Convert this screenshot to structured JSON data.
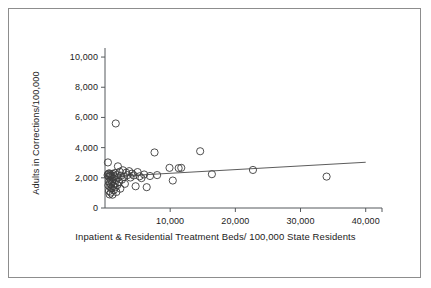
{
  "chart_data": {
    "type": "scatter",
    "title": "",
    "xlabel": "Inpatient & Residential Treatment Beds/ 100,000 State Residents",
    "ylabel": "Adults in Corrections/100,000",
    "xlim": [
      0,
      42500
    ],
    "ylim": [
      0,
      10600
    ],
    "xticks": [
      0,
      10000,
      20000,
      30000,
      40000
    ],
    "xtick_labels": [
      "0",
      "10,000",
      "20,000",
      "30,000",
      "40,000"
    ],
    "yticks": [
      0,
      2000,
      4000,
      6000,
      8000,
      10000
    ],
    "ytick_labels": [
      "0",
      "2,000",
      "4,000",
      "6,000",
      "8,000",
      "10,000"
    ],
    "grid": false,
    "legend": null,
    "marker": "open-circle",
    "marker_color": "#3c3c3c",
    "points": [
      [
        400,
        2180
      ],
      [
        450,
        3020
      ],
      [
        500,
        2260
      ],
      [
        520,
        1500
      ],
      [
        560,
        2080
      ],
      [
        600,
        1120
      ],
      [
        620,
        1760
      ],
      [
        650,
        2300
      ],
      [
        700,
        900
      ],
      [
        720,
        1640
      ],
      [
        760,
        2120
      ],
      [
        800,
        1380
      ],
      [
        830,
        2240
      ],
      [
        880,
        1860
      ],
      [
        900,
        1020
      ],
      [
        950,
        1560
      ],
      [
        980,
        2160
      ],
      [
        1020,
        1300
      ],
      [
        1060,
        2020
      ],
      [
        1100,
        1700
      ],
      [
        1150,
        880
      ],
      [
        1200,
        2260
      ],
      [
        1250,
        1460
      ],
      [
        1300,
        1940
      ],
      [
        1350,
        1180
      ],
      [
        1420,
        2100
      ],
      [
        1480,
        1620
      ],
      [
        1550,
        2320
      ],
      [
        1600,
        1380
      ],
      [
        1650,
        5600
      ],
      [
        1700,
        1860
      ],
      [
        1750,
        1060
      ],
      [
        1820,
        2180
      ],
      [
        1900,
        1520
      ],
      [
        1980,
        2760
      ],
      [
        2050,
        2020
      ],
      [
        2150,
        1720
      ],
      [
        2250,
        2400
      ],
      [
        2350,
        1280
      ],
      [
        2450,
        2140
      ],
      [
        2600,
        1880
      ],
      [
        2750,
        2500
      ],
      [
        2900,
        2060
      ],
      [
        3050,
        1600
      ],
      [
        3250,
        2340
      ],
      [
        3450,
        2180
      ],
      [
        3700,
        2440
      ],
      [
        3900,
        2020
      ],
      [
        4150,
        2280
      ],
      [
        4400,
        2160
      ],
      [
        4700,
        1440
      ],
      [
        5000,
        2380
      ],
      [
        5300,
        2100
      ],
      [
        5600,
        1980
      ],
      [
        6000,
        2220
      ],
      [
        6400,
        1380
      ],
      [
        6900,
        2120
      ],
      [
        7600,
        3680
      ],
      [
        8000,
        2180
      ],
      [
        9900,
        2660
      ],
      [
        10400,
        1820
      ],
      [
        11300,
        2640
      ],
      [
        11700,
        2660
      ],
      [
        14600,
        3760
      ],
      [
        16400,
        2240
      ],
      [
        22700,
        2520
      ],
      [
        34000,
        2080
      ]
    ],
    "trend_line": {
      "x_start": 1000,
      "y_start": 2080,
      "x_end": 40000,
      "y_end": 3030,
      "color": "#4a4a4a"
    }
  }
}
